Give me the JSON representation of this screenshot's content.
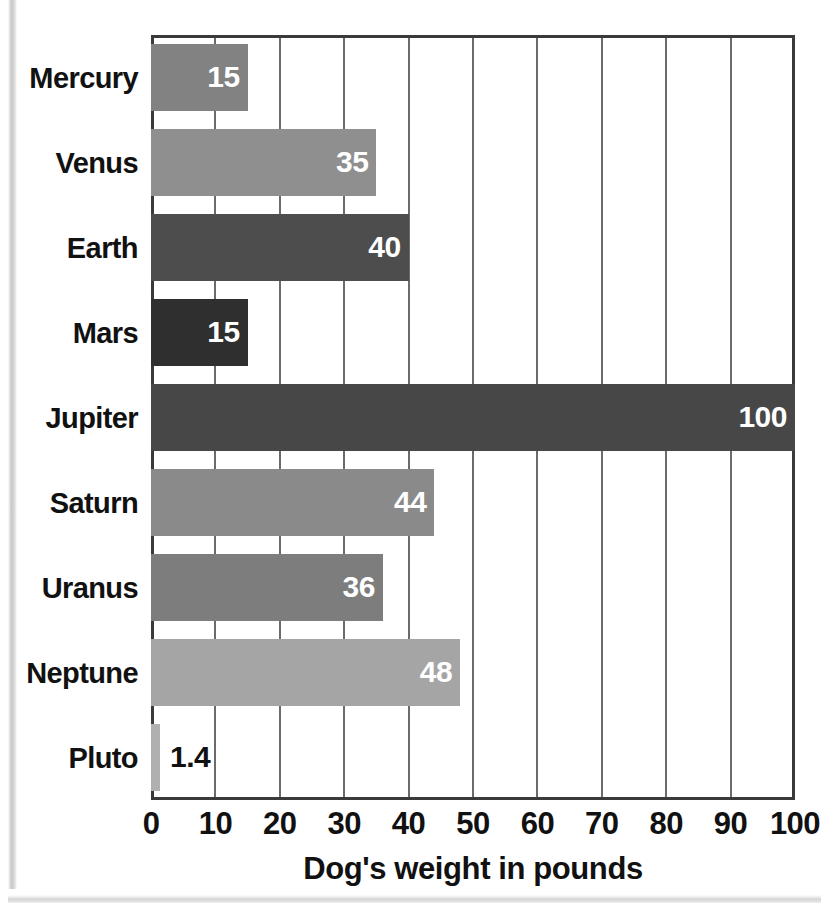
{
  "chart_data": {
    "type": "bar",
    "orientation": "horizontal",
    "title": "",
    "xlabel": "Dog's weight in pounds",
    "ylabel": "",
    "xlim": [
      0,
      100
    ],
    "xticks": [
      0,
      10,
      20,
      30,
      40,
      50,
      60,
      70,
      80,
      90,
      100
    ],
    "xtick_labels": [
      "0",
      "10",
      "20",
      "30",
      "40",
      "50",
      "60",
      "70",
      "80",
      "90",
      "100"
    ],
    "grid": "vertical",
    "legend": "none",
    "categories": [
      "Mercury",
      "Venus",
      "Earth",
      "Mars",
      "Jupiter",
      "Saturn",
      "Uranus",
      "Neptune",
      "Pluto"
    ],
    "values": [
      15,
      35,
      40,
      15,
      100,
      44,
      36,
      48,
      1.4
    ],
    "value_labels": [
      "15",
      "35",
      "40",
      "15",
      "100",
      "44",
      "36",
      "48",
      "1.4"
    ],
    "bar_colors": [
      "#828282",
      "#8f8f8f",
      "#4d4d4d",
      "#2f2f2f",
      "#474747",
      "#8a8a8a",
      "#7d7d7d",
      "#a5a5a5",
      "#b0b0b0"
    ],
    "label_placement": [
      "inside",
      "inside",
      "inside",
      "inside",
      "inside",
      "inside",
      "inside",
      "inside",
      "outside"
    ],
    "bars": [
      {
        "category": "Mercury",
        "value": 15,
        "label": "15",
        "color": "#828282",
        "label_placement": "inside"
      },
      {
        "category": "Venus",
        "value": 35,
        "label": "35",
        "color": "#8f8f8f",
        "label_placement": "inside"
      },
      {
        "category": "Earth",
        "value": 40,
        "label": "40",
        "color": "#4d4d4d",
        "label_placement": "inside"
      },
      {
        "category": "Mars",
        "value": 15,
        "label": "15",
        "color": "#2f2f2f",
        "label_placement": "inside"
      },
      {
        "category": "Jupiter",
        "value": 100,
        "label": "100",
        "color": "#474747",
        "label_placement": "inside"
      },
      {
        "category": "Saturn",
        "value": 44,
        "label": "44",
        "color": "#8a8a8a",
        "label_placement": "inside"
      },
      {
        "category": "Uranus",
        "value": 36,
        "label": "36",
        "color": "#7d7d7d",
        "label_placement": "inside"
      },
      {
        "category": "Neptune",
        "value": 48,
        "label": "48",
        "color": "#a5a5a5",
        "label_placement": "inside"
      },
      {
        "category": "Pluto",
        "value": 1.4,
        "label": "1.4",
        "color": "#b0b0b0",
        "label_placement": "outside"
      }
    ]
  },
  "style": {
    "axis_color": "#3a3a3a",
    "grid_color": "#6b6b6b",
    "text_color": "#111111",
    "inside_label_color": "#ffffff",
    "background": "#ffffff"
  }
}
